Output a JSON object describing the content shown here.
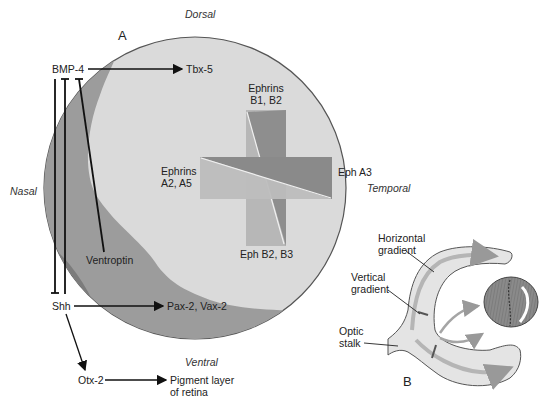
{
  "panel_a": {
    "label": "A",
    "orientation": {
      "dorsal": "Dorsal",
      "ventral": "Ventral",
      "nasal": "Nasal",
      "temporal": "Temporal"
    },
    "genes": {
      "bmp4": "BMP-4",
      "tbx5": "Tbx-5",
      "ventroptin": "Ventroptin",
      "shh": "Shh",
      "pax2_vax2": "Pax-2, Vax-2",
      "otx2": "Otx-2",
      "pigment_line1": "Pigment layer",
      "pigment_line2": "of retina"
    },
    "gradients": {
      "ephrins_b_line1": "Ephrins",
      "ephrins_b_line2": "B1, B2",
      "ephrins_a_line1": "Ephrins",
      "ephrins_a_line2": "A2, A5",
      "eph_a3": "Eph A3",
      "eph_b2_b3": "Eph B2, B3"
    }
  },
  "panel_b": {
    "label": "B",
    "horizontal_gradient_line1": "Horizontal",
    "horizontal_gradient_line2": "gradient",
    "vertical_gradient_line1": "Vertical",
    "vertical_gradient_line2": "gradient",
    "optic_stalk_line1": "Optic",
    "optic_stalk_line2": "stalk"
  },
  "colors": {
    "retina_light": "#d9d9d9",
    "dorsal_band": "#9a9a9a",
    "ventral_band": "#7a7a7a",
    "cross_light": "#b8b8b8",
    "cross_dark": "#8c8c8c",
    "outline": "#555555"
  }
}
